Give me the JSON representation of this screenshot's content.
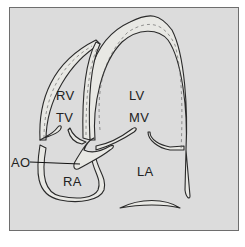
{
  "diagram": {
    "labels": {
      "rv": "RV",
      "tv": "TV",
      "lv": "LV",
      "mv": "MV",
      "ao": "AO",
      "ra": "RA",
      "la": "LA"
    },
    "colors": {
      "background": "#dcdcdc",
      "wall_fill": "#e8e8e4",
      "stroke": "#2a2a2a",
      "border": "#6e6e6e"
    }
  }
}
